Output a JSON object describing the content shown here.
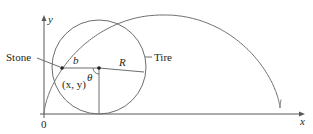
{
  "diagram": {
    "axes": {
      "x_label": "x",
      "y_label": "y",
      "origin_label": "0"
    },
    "labels": {
      "stone": "Stone",
      "tire": "Tire",
      "point": "(x, y)",
      "b": "b",
      "R": "R",
      "theta": "θ"
    },
    "colors": {
      "line": "#6d6e71",
      "axis": "#58595b",
      "text": "#231f20",
      "background": "#ffffff"
    }
  }
}
